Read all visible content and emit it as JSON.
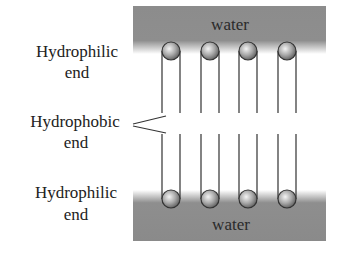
{
  "diagram": {
    "type": "lipid-bilayer",
    "water_regions": [
      {
        "id": "top",
        "label": "water"
      },
      {
        "id": "bottom",
        "label": "water"
      }
    ],
    "labels": {
      "top_hydrophilic": {
        "line1": "Hydrophilic",
        "line2": "end"
      },
      "hydrophobic": {
        "line1": "Hydrophobic",
        "line2": "end"
      },
      "bottom_hydrophilic": {
        "line1": "Hydrophilic",
        "line2": "end"
      }
    },
    "molecules_per_layer": 4,
    "colors": {
      "water": "#8c8c8c",
      "background": "#ffffff",
      "line": "#333333",
      "head_light": "#f2f2f2",
      "head_dark": "#6a6a6a"
    }
  }
}
